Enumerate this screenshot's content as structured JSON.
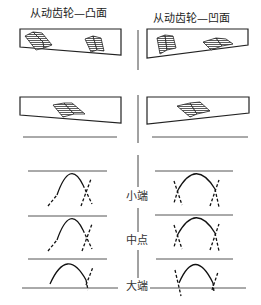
{
  "titles": {
    "left": "从动齿轮—凸面",
    "right": "从动齿轮—凹面"
  },
  "positions": {
    "toe": "小端",
    "middle": "中点",
    "heel": "大端"
  },
  "colors": {
    "line": "#222222",
    "guide": "#555555",
    "background": "#ffffff"
  }
}
